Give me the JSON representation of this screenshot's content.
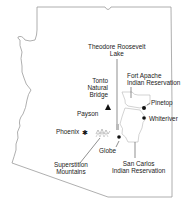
{
  "map": {
    "region": "Arizona",
    "colors": {
      "outline": "#9a9a9a",
      "text": "#222222",
      "marker": "#111111",
      "reservation_border": "#b5b5b5"
    },
    "labels": {
      "roosevelt_lake": [
        "Theodore Roosevelt",
        "Lake"
      ],
      "tonto_bridge": [
        "Tonto",
        "Natural",
        "Bridge"
      ],
      "fort_apache": [
        "Fort Apache",
        "Indian Reservation"
      ],
      "pinetop": "Pinetop",
      "payson": "Payson",
      "whiteriver": "Whiteriver",
      "phoenix": "Phoenix",
      "globe": "Globe",
      "superstition": [
        "Superstition",
        "Mountains"
      ],
      "san_carlos": [
        "San Carlos",
        "Indian Reservation"
      ]
    },
    "markers": [
      {
        "name": "Tonto Natural Bridge",
        "type": "triangle"
      },
      {
        "name": "Pinetop",
        "type": "dot"
      },
      {
        "name": "Whiteriver",
        "type": "dot"
      },
      {
        "name": "Phoenix",
        "type": "star"
      },
      {
        "name": "Globe",
        "type": "dot"
      }
    ]
  }
}
